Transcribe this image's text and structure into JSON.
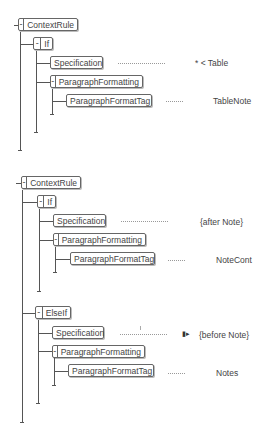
{
  "rules": [
    {
      "root": "ContextRule",
      "branches": [
        {
          "label": "If",
          "specification": {
            "label": "Specification",
            "value": "* < Table"
          },
          "formatting": {
            "label": "ParagraphFormatting",
            "tag_label": "ParagraphFormatTag",
            "tag_value": "TableNote"
          }
        }
      ]
    },
    {
      "root": "ContextRule",
      "branches": [
        {
          "label": "If",
          "specification": {
            "label": "Specification",
            "value": "{after  Note}"
          },
          "formatting": {
            "label": "ParagraphFormatting",
            "tag_label": "ParagraphFormatTag",
            "tag_value": "NoteCont"
          }
        },
        {
          "label": "ElseIf",
          "specification": {
            "label": "Specification",
            "value": "{before  Note}"
          },
          "formatting": {
            "label": "ParagraphFormatting",
            "tag_label": "ParagraphFormatTag",
            "tag_value": "Notes"
          }
        }
      ]
    }
  ],
  "toggle_symbol": "-",
  "icons": {
    "cursor_marker": "insertion-marker"
  }
}
